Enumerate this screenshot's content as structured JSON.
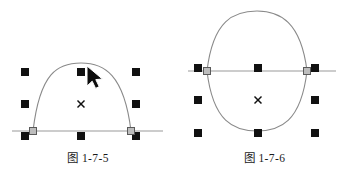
{
  "document": {
    "background_color": "#ffffff",
    "ink_color": "#1a1a1a",
    "curve_color": "#808080",
    "axis_color": "#999999",
    "handle_fill": "#111111",
    "node_fill": "#b0b0b0",
    "node_stroke": "#555555"
  },
  "figures": [
    {
      "id": "figure-1-7-5",
      "caption": "图 1-7-5",
      "description": "open arc shape with eight selection handles, center marker and mouse cursor",
      "center_marker": {
        "glyph": "×",
        "x": 81,
        "y": 104
      },
      "cursor": {
        "icon": "arrow-cursor",
        "x": 87,
        "y": 66
      },
      "baseline": {
        "x1": 12,
        "y1": 131,
        "x2": 163,
        "y2": 131
      },
      "handles": [
        {
          "name": "handle-top-left",
          "x": 25,
          "y": 72
        },
        {
          "name": "handle-top-center",
          "x": 81,
          "y": 72
        },
        {
          "name": "handle-top-right",
          "x": 136,
          "y": 72
        },
        {
          "name": "handle-middle-left",
          "x": 25,
          "y": 104
        },
        {
          "name": "handle-middle-right",
          "x": 136,
          "y": 104
        },
        {
          "name": "handle-bottom-left",
          "x": 25,
          "y": 136
        },
        {
          "name": "handle-bottom-center",
          "x": 81,
          "y": 136
        },
        {
          "name": "handle-bottom-right",
          "x": 136,
          "y": 136
        }
      ],
      "nodes": [
        {
          "name": "curve-node-left",
          "x": 33,
          "y": 131
        },
        {
          "name": "curve-node-right",
          "x": 131,
          "y": 131
        }
      ],
      "path": "M 33 131 C 40 72 58 63 81 63 C 104 63 124 74 131 131"
    },
    {
      "id": "figure-1-7-6",
      "caption": "图 1-7-6",
      "description": "closed egg shaped curve with eight selection handles and center marker",
      "center_marker": {
        "glyph": "×",
        "x": 82,
        "y": 100
      },
      "baseline": {
        "x1": 12,
        "y1": 71,
        "x2": 160,
        "y2": 71
      },
      "handles": [
        {
          "name": "handle-top-left",
          "x": 22,
          "y": 68
        },
        {
          "name": "handle-top-center",
          "x": 82,
          "y": 68
        },
        {
          "name": "handle-top-right",
          "x": 139,
          "y": 68
        },
        {
          "name": "handle-middle-left",
          "x": 22,
          "y": 100
        },
        {
          "name": "handle-middle-right",
          "x": 139,
          "y": 100
        },
        {
          "name": "handle-bottom-left",
          "x": 22,
          "y": 133
        },
        {
          "name": "handle-bottom-center",
          "x": 82,
          "y": 133
        },
        {
          "name": "handle-bottom-right",
          "x": 139,
          "y": 133
        }
      ],
      "nodes": [
        {
          "name": "curve-node-left",
          "x": 31,
          "y": 71
        },
        {
          "name": "curve-node-right",
          "x": 131,
          "y": 71
        }
      ],
      "path_top": "M 31 71 C 37 20 58 11 81 11 C 104 11 125 22 131 71",
      "path_bottom": "M 31 71 C 37 122 58 131 81 131 C 104 131 125 122 131 71"
    }
  ]
}
